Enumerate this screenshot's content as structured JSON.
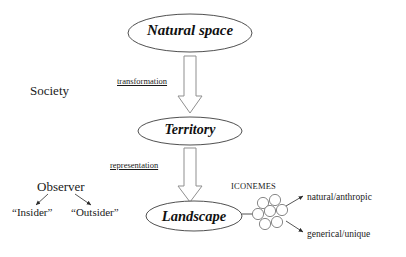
{
  "diagram": {
    "colors": {
      "stroke": "#3c3c3c",
      "arrow_stroke": "#8a8a8a",
      "text": "#1a1a1a",
      "background": "#ffffff"
    },
    "nodes": [
      {
        "id": "natural-space",
        "label": "Natural space",
        "shape": "ellipse"
      },
      {
        "id": "territory",
        "label": "Territory",
        "shape": "ellipse"
      },
      {
        "id": "landscape",
        "label": "Landscape",
        "shape": "ellipse"
      }
    ],
    "edges": [
      {
        "id": "transformation",
        "label": "transformation",
        "from": "natural-space",
        "to": "territory",
        "style": "block-arrow-down"
      },
      {
        "id": "representation",
        "label": "representation",
        "from": "territory",
        "to": "landscape",
        "style": "block-arrow-down"
      }
    ],
    "annotations": {
      "society": "Society",
      "observer": "Observer",
      "insider": "“Insider”",
      "outsider": "“Outsider”",
      "iconemes": "ICONEMES",
      "natural_anthropic": "natural/anthropic",
      "generical_unique": "generical/unique"
    },
    "iconeme_cluster": {
      "circle_count": 7,
      "arrangement": "honeycomb"
    }
  }
}
